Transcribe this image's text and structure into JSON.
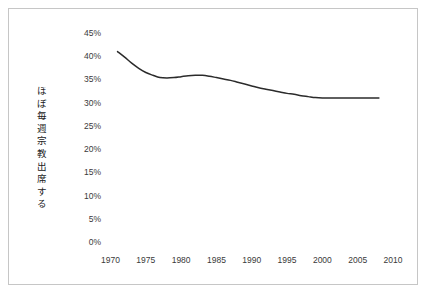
{
  "figure": {
    "background_color": "#ffffff",
    "border_color": "#c6c6c6",
    "line_color": "#2b2b2b",
    "tick_text_color": "#3a3a3a",
    "label_text_color": "#1b1b1b"
  },
  "chart_data": {
    "type": "line",
    "title": "",
    "subtitle": "",
    "xlabel": "",
    "ylabel": "ほぼ毎週宗教出席する",
    "ylabel_chars": [
      "ほ",
      "ぼ",
      "毎",
      "週",
      "宗",
      "教",
      "出",
      "席",
      "す",
      "る"
    ],
    "xlim": [
      1970,
      2010
    ],
    "ylim": [
      0,
      45
    ],
    "ytick_values": [
      0,
      5,
      10,
      15,
      20,
      25,
      30,
      35,
      40,
      45
    ],
    "ytick_labels": [
      "0%",
      "5%",
      "10%",
      "15%",
      "20%",
      "25%",
      "30%",
      "35%",
      "40%",
      "45%"
    ],
    "xtick_values": [
      1970,
      1975,
      1980,
      1985,
      1990,
      1995,
      2000,
      2005,
      2010
    ],
    "xtick_labels": [
      "1970",
      "1975",
      "1980",
      "1985",
      "1990",
      "1995",
      "2000",
      "2005",
      "2010"
    ],
    "grid": false,
    "legend": false,
    "legend_position": "none",
    "annotations": [],
    "series": [
      {
        "name": "ほぼ毎週宗教出席する",
        "color": "#2b2b2b",
        "x": [
          1971,
          1972,
          1973,
          1974,
          1975,
          1976,
          1977,
          1978,
          1979,
          1980,
          1981,
          1982,
          1983,
          1984,
          1985,
          1986,
          1987,
          1988,
          1989,
          1990,
          1991,
          1992,
          1993,
          1994,
          1995,
          1996,
          1997,
          1998,
          1999,
          2000,
          2001,
          2002,
          2003,
          2004,
          2005,
          2006,
          2007,
          2008
        ],
        "values": [
          41.0,
          39.8,
          38.5,
          37.4,
          36.5,
          35.9,
          35.4,
          35.3,
          35.4,
          35.6,
          35.8,
          35.9,
          35.9,
          35.7,
          35.4,
          35.1,
          34.8,
          34.4,
          34.0,
          33.6,
          33.2,
          32.9,
          32.6,
          32.3,
          32.0,
          31.8,
          31.5,
          31.3,
          31.1,
          31.0,
          31.0,
          31.0,
          31.0,
          31.0,
          31.0,
          31.0,
          31.0,
          31.0
        ]
      }
    ]
  }
}
